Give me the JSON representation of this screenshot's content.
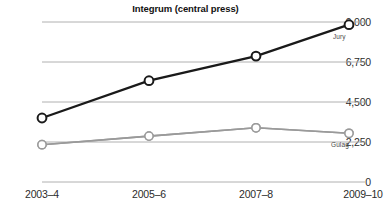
{
  "chart_data": {
    "type": "line",
    "title": "Integrum (central press)",
    "xlabel": "",
    "ylabel": "",
    "categories": [
      "2003–4",
      "2005–6",
      "2007–8",
      "2009–10"
    ],
    "ylim": [
      0,
      9000
    ],
    "yticks": [
      0,
      2250,
      4500,
      6750,
      9000
    ],
    "ytick_labels": [
      "0",
      "2,250",
      "4,500",
      "6,750",
      "9,000"
    ],
    "grid": true,
    "legend_position": "inline-right",
    "series": [
      {
        "name": "Jury",
        "values": [
          3600,
          5700,
          7080,
          8850
        ],
        "color": "#1a1a1a",
        "marker": "open-circle"
      },
      {
        "name": "Gulag",
        "values": [
          2100,
          2580,
          3050,
          2740
        ],
        "color": "#9a9a9a",
        "marker": "open-circle"
      }
    ],
    "annotations": [
      {
        "text": "Jury",
        "series": "Jury"
      },
      {
        "text": "Gulag",
        "series": "Gulag"
      }
    ]
  },
  "colors": {
    "background": "#ffffff",
    "gridline": "#b4b4b4",
    "axis_text": "#2b2b2b",
    "jury": "#1a1a1a",
    "gulag": "#9a9a9a"
  }
}
